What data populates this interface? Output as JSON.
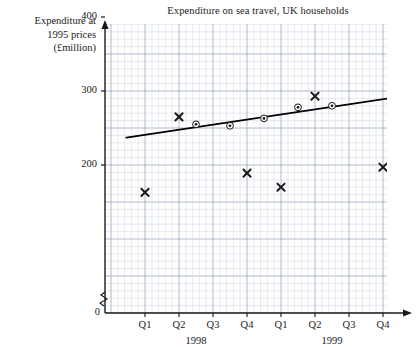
{
  "title": "Expenditure on sea travel, UK households",
  "y_axis_label_lines": [
    "Expenditure at",
    "1995 prices",
    "(£million)"
  ],
  "zero_label": "0",
  "y_ticks": [
    {
      "value": 200,
      "label": "200"
    },
    {
      "value": 300,
      "label": "300"
    },
    {
      "value": 400,
      "label": "400"
    }
  ],
  "x_ticks": [
    {
      "label": "Q1",
      "year": "1998"
    },
    {
      "label": "Q2",
      "year": "1998"
    },
    {
      "label": "Q3",
      "year": "1998"
    },
    {
      "label": "Q4",
      "year": "1998"
    },
    {
      "label": "Q1",
      "year": "1999"
    },
    {
      "label": "Q2",
      "year": "1999"
    },
    {
      "label": "Q3",
      "year": "1999"
    },
    {
      "label": "Q4",
      "year": "1999"
    }
  ],
  "year_groups": [
    {
      "label": "1998"
    },
    {
      "label": "1999"
    }
  ],
  "colors": {
    "ink": "#1a1a1a",
    "grid_minor": "#cfd6e4",
    "grid_major": "#9aa6bd",
    "marker": "#1a1a1a",
    "trend": "#000000"
  },
  "chart_data": {
    "type": "scatter",
    "title": "Expenditure on sea travel, UK households",
    "xlabel": "",
    "ylabel": "Expenditure at 1995 prices (£million)",
    "ylim": [
      0,
      480
    ],
    "y_axis_break": true,
    "grid": true,
    "legend": "none",
    "categories": [
      "1998 Q1",
      "1998 Q2",
      "1998 Q3",
      "1998 Q4",
      "1999 Q1",
      "1999 Q2",
      "1999 Q3",
      "1999 Q4"
    ],
    "series": [
      {
        "name": "Quarterly expenditure",
        "marker": "cross",
        "x": [
          1,
          2,
          3,
          4,
          5,
          6,
          7,
          8
        ],
        "values": [
          163,
          265,
          407,
          189,
          170,
          293,
          466,
          197
        ]
      },
      {
        "name": "Four-quarter moving average (centred)",
        "marker": "circled-dot",
        "x": [
          2.5,
          3.5,
          4.5,
          5.5,
          6.5
        ],
        "values": [
          255,
          253,
          263,
          278,
          280
        ]
      }
    ],
    "trend_line": {
      "name": "Trend line",
      "x_start": 0.45,
      "y_start": 237,
      "x_end": 8.45,
      "y_end": 292
    }
  }
}
